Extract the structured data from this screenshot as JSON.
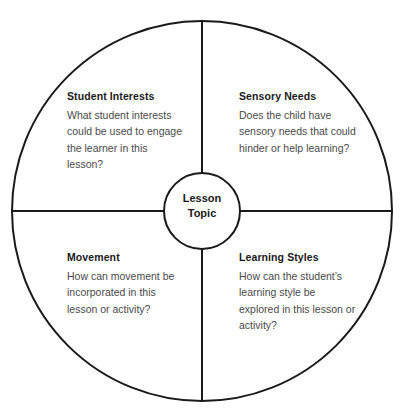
{
  "diagram": {
    "type": "four-quadrant-wheel",
    "hub": {
      "line1": "Lesson",
      "line2": "Topic"
    },
    "colors": {
      "stroke": "#1a1a1a",
      "heading_text": "#1a1a1a",
      "body_text": "#4a4a4a",
      "background": "#ffffff"
    },
    "geometry": {
      "center_x": 202,
      "center_y": 211,
      "outer_radius": 190,
      "hub_radius": 38,
      "stroke_width": 2
    },
    "quadrants": [
      {
        "position": "top-left",
        "heading": "Student Interests",
        "body": "What student interests could be used to engage the learner in this lesson?"
      },
      {
        "position": "top-right",
        "heading": "Sensory Needs",
        "body": "Does the child have sensory needs that could hinder or help learning?"
      },
      {
        "position": "bottom-left",
        "heading": "Movement",
        "body": "How can movement be incorporated in this lesson or activity?"
      },
      {
        "position": "bottom-right",
        "heading": "Learning Styles",
        "body": "How can the student’s learning style be explored in this lesson or activity?"
      }
    ],
    "artifact_text": ""
  }
}
